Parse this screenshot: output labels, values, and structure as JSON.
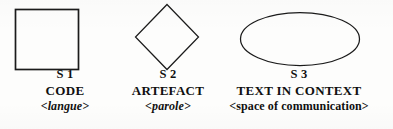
{
  "figure": {
    "background_color": "#fdfdfc",
    "stroke_color": "#1b1b1b",
    "groups": [
      {
        "shape": "square",
        "shape_icon_name": "square-shape",
        "id_label": "S 1",
        "name_label": "CODE",
        "gloss_label": "<langue>",
        "gloss_style": "italic"
      },
      {
        "shape": "diamond",
        "shape_icon_name": "diamond-shape",
        "id_label": "S 2",
        "name_label": "ARTEFACT",
        "gloss_label": "<parole>",
        "gloss_style": "italic"
      },
      {
        "shape": "ellipse",
        "shape_icon_name": "ellipse-shape",
        "id_label": "S 3",
        "name_label": "TEXT IN CONTEXT",
        "gloss_label": "<space of communication>",
        "gloss_style": "upright"
      }
    ]
  }
}
